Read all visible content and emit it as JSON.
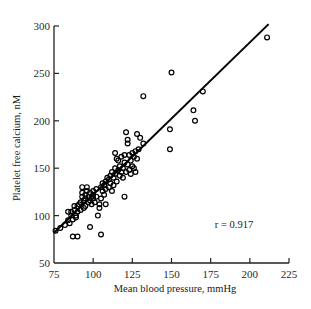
{
  "chart_data": {
    "type": "scatter",
    "title": "",
    "xlabel": "Mean blood pressure, mmHg",
    "ylabel": "Platelet free calcium, nM",
    "xlim": [
      75,
      225
    ],
    "ylim": [
      50,
      300
    ],
    "xticks": [
      75,
      100,
      125,
      150,
      175,
      200,
      225
    ],
    "yticks": [
      50,
      100,
      150,
      200,
      250,
      300
    ],
    "grid": false,
    "legend": null,
    "marker": "open-circle",
    "annotations": [
      {
        "text": "r = 0.917",
        "x": 185,
        "y": 100
      }
    ],
    "regression_line": {
      "x": [
        75,
        212
      ],
      "y": [
        82,
        302
      ]
    },
    "series": [
      {
        "name": "observations",
        "points": [
          [
            76,
            84
          ],
          [
            79,
            87
          ],
          [
            82,
            90
          ],
          [
            84,
            95
          ],
          [
            84,
            104
          ],
          [
            85,
            92
          ],
          [
            86,
            100
          ],
          [
            86,
            104
          ],
          [
            87,
            78
          ],
          [
            87,
            96
          ],
          [
            88,
            106
          ],
          [
            88,
            110
          ],
          [
            89,
            98
          ],
          [
            89,
            100
          ],
          [
            90,
            78
          ],
          [
            90,
            104
          ],
          [
            90,
            110
          ],
          [
            91,
            112
          ],
          [
            92,
            106
          ],
          [
            92,
            114
          ],
          [
            93,
            120
          ],
          [
            93,
            124
          ],
          [
            93,
            130
          ],
          [
            94,
            108
          ],
          [
            94,
            116
          ],
          [
            95,
            110
          ],
          [
            95,
            118
          ],
          [
            95,
            122
          ],
          [
            96,
            126
          ],
          [
            96,
            130
          ],
          [
            97,
            114
          ],
          [
            97,
            120
          ],
          [
            98,
            88
          ],
          [
            98,
            124
          ],
          [
            98,
            116
          ],
          [
            99,
            120
          ],
          [
            99,
            112
          ],
          [
            100,
            118
          ],
          [
            100,
            122
          ],
          [
            100,
            126
          ],
          [
            101,
            114
          ],
          [
            102,
            120
          ],
          [
            102,
            128
          ],
          [
            103,
            100
          ],
          [
            104,
            108
          ],
          [
            104,
            112
          ],
          [
            105,
            80
          ],
          [
            105,
            118
          ],
          [
            105,
            130
          ],
          [
            106,
            126
          ],
          [
            106,
            134
          ],
          [
            107,
            122
          ],
          [
            107,
            132
          ],
          [
            108,
            112
          ],
          [
            108,
            136
          ],
          [
            108,
            128
          ],
          [
            109,
            140
          ],
          [
            110,
            130
          ],
          [
            110,
            138
          ],
          [
            111,
            142
          ],
          [
            111,
            134
          ],
          [
            112,
            126
          ],
          [
            112,
            146
          ],
          [
            113,
            140
          ],
          [
            113,
            132
          ],
          [
            114,
            144
          ],
          [
            114,
            150
          ],
          [
            114,
            166
          ],
          [
            115,
            160
          ],
          [
            115,
            136
          ],
          [
            116,
            148
          ],
          [
            116,
            158
          ],
          [
            117,
            142
          ],
          [
            117,
            152
          ],
          [
            118,
            146
          ],
          [
            118,
            162
          ],
          [
            119,
            150
          ],
          [
            119,
            140
          ],
          [
            120,
            120
          ],
          [
            120,
            156
          ],
          [
            120,
            164
          ],
          [
            121,
            146
          ],
          [
            121,
            188
          ],
          [
            122,
            176
          ],
          [
            122,
            180
          ],
          [
            122,
            154
          ],
          [
            123,
            148
          ],
          [
            123,
            164
          ],
          [
            124,
            144
          ],
          [
            124,
            158
          ],
          [
            125,
            152
          ],
          [
            125,
            166
          ],
          [
            126,
            150
          ],
          [
            126,
            162
          ],
          [
            127,
            146
          ],
          [
            127,
            168
          ],
          [
            128,
            186
          ],
          [
            128,
            160
          ],
          [
            129,
            170
          ],
          [
            130,
            182
          ],
          [
            132,
            226
          ],
          [
            132,
            176
          ],
          [
            149,
            191
          ],
          [
            149,
            170
          ],
          [
            150,
            251
          ],
          [
            164,
            211
          ],
          [
            165,
            200
          ],
          [
            170,
            231
          ],
          [
            211,
            288
          ]
        ]
      }
    ]
  }
}
